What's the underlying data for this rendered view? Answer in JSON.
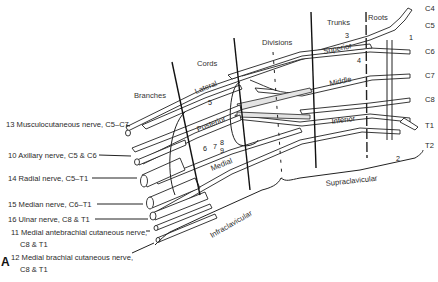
{
  "figure": {
    "panel_label": "A",
    "sections": {
      "branches": "Branches",
      "cords": "Cords",
      "divisions": "Divisions",
      "trunks": "Trunks",
      "roots": "Roots"
    },
    "roots": [
      "C4",
      "C5",
      "C6",
      "C7",
      "C8",
      "T1",
      "T2"
    ],
    "trunks": {
      "superior": "Superior",
      "middle": "Middle",
      "inferior": "Inferior"
    },
    "cords": {
      "lateral": "Lateral",
      "posterior": "Posterior",
      "medial": "Medial"
    },
    "regions": {
      "supraclavicular": "Supraclavicular",
      "infraclavicular": "Infraclavicular"
    },
    "branch_numbers": [
      "1",
      "2",
      "3",
      "4",
      "5",
      "6",
      "7",
      "8",
      "9"
    ],
    "branches": [
      {
        "label": "13 Musculocutaneous nerve, C5–C7"
      },
      {
        "label": "10 Axillary nerve, C5 & C6"
      },
      {
        "label": "14 Radial nerve, C5–T1"
      },
      {
        "label": "15 Median nerve, C6–T1"
      },
      {
        "label": "16 Ulnar nerve, C8 & T1"
      },
      {
        "label": "11 Medial antebrachial cutaneous nerve,",
        "label2": "C8 & T1"
      },
      {
        "label": "12 Medial brachial cutaneous nerve,",
        "label2": "C8 & T1"
      }
    ]
  }
}
